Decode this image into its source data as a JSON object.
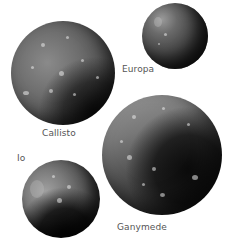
{
  "figure": {
    "moons": [
      {
        "id": "callisto",
        "label": "Callisto"
      },
      {
        "id": "europa",
        "label": "Europa"
      },
      {
        "id": "ganymede",
        "label": "Ganymede"
      },
      {
        "id": "io",
        "label": "Io"
      }
    ]
  },
  "colors": {
    "background": "#ffffff",
    "label_text": "#555555"
  }
}
